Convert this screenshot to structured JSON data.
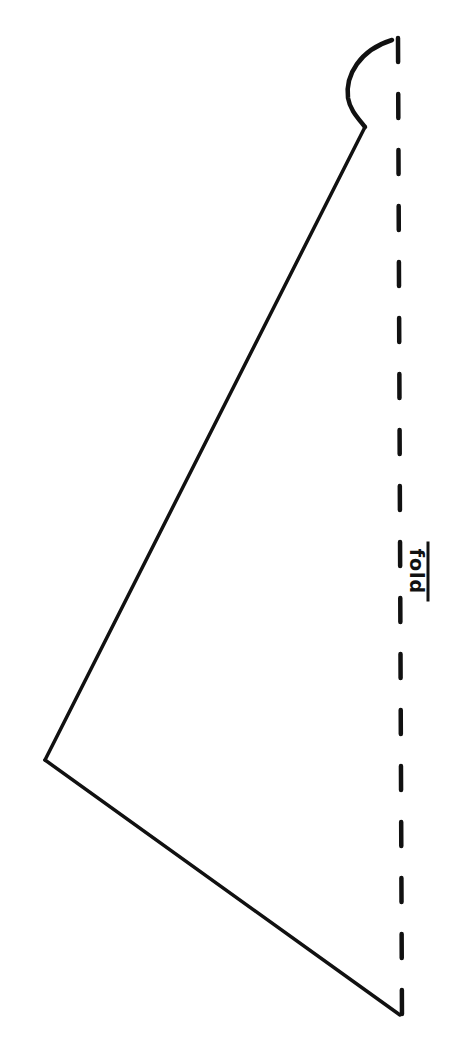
{
  "diagram": {
    "type": "pattern-piece",
    "stroke_color": "#111111",
    "background": "#ffffff",
    "fold_line": {
      "label": "fold",
      "style": "dashed",
      "x": 398,
      "y_start": 36,
      "y_end": 1024
    },
    "outline": {
      "points": [
        {
          "x": 398,
          "y": 38
        },
        {
          "x": 348,
          "y": 100
        },
        {
          "x": 365,
          "y": 127
        },
        {
          "x": 45,
          "y": 760
        },
        {
          "x": 400,
          "y": 1015
        }
      ],
      "segments": [
        {
          "from": 0,
          "to": 2,
          "kind": "curve"
        },
        {
          "from": 2,
          "to": 3,
          "kind": "line"
        },
        {
          "from": 3,
          "to": 4,
          "kind": "line"
        }
      ]
    }
  }
}
